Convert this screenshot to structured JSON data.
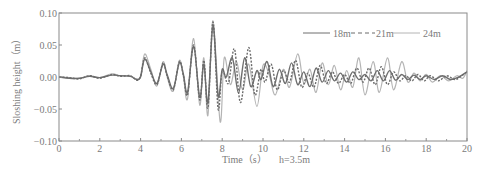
{
  "chart_data": {
    "type": "line",
    "title": "",
    "xlabel": "Time（s）",
    "annotation": "h=3.5m",
    "ylabel": "Sloshing height（m）",
    "xlim": [
      0,
      20
    ],
    "ylim": [
      -0.1,
      0.1
    ],
    "x_ticks": [
      0,
      2,
      4,
      6,
      8,
      10,
      12,
      14,
      16,
      18,
      20
    ],
    "x_tick_labels": [
      "0",
      "2",
      "4",
      "6",
      "8",
      "10",
      "12",
      "14",
      "16",
      "18",
      "20"
    ],
    "x_minor_ticks": [
      1,
      3,
      5,
      7,
      9,
      11,
      13,
      15,
      17,
      19
    ],
    "y_ticks": [
      0.1,
      0.05,
      0.0,
      -0.05,
      -0.1
    ],
    "y_tick_labels": [
      "0.10",
      "0.05",
      "0.00",
      "−0.05",
      "−0.10"
    ],
    "grid": false,
    "legend_position": "upper right",
    "series": [
      {
        "name": "18m",
        "style": "solid",
        "color": "#6e6e6e",
        "keypoints": [
          [
            0,
            0.0
          ],
          [
            0.5,
            -0.002
          ],
          [
            1.0,
            -0.002
          ],
          [
            1.5,
            0.001
          ],
          [
            2.0,
            -0.001
          ],
          [
            2.6,
            0.003
          ],
          [
            3.0,
            0.002
          ],
          [
            3.5,
            0.001
          ],
          [
            3.8,
            -0.004
          ],
          [
            4.0,
            0.0
          ],
          [
            4.2,
            0.028
          ],
          [
            4.5,
            0.008
          ],
          [
            4.8,
            -0.01
          ],
          [
            5.1,
            0.02
          ],
          [
            5.3,
            0.004
          ],
          [
            5.6,
            -0.018
          ],
          [
            5.9,
            0.022
          ],
          [
            6.1,
            0.004
          ],
          [
            6.3,
            -0.024
          ],
          [
            6.6,
            0.048
          ],
          [
            6.9,
            -0.032
          ],
          [
            7.1,
            0.02
          ],
          [
            7.3,
            -0.04
          ],
          [
            7.55,
            0.08
          ],
          [
            7.8,
            -0.03
          ],
          [
            8.0,
            0.012
          ],
          [
            8.2,
            0.0
          ],
          [
            8.5,
            0.03
          ],
          [
            8.8,
            -0.025
          ],
          [
            9.1,
            0.03
          ],
          [
            9.4,
            -0.015
          ],
          [
            9.7,
            0.01
          ],
          [
            9.9,
            -0.004
          ],
          [
            10.2,
            0.024
          ],
          [
            10.5,
            -0.015
          ],
          [
            10.8,
            0.012
          ],
          [
            11.1,
            -0.01
          ],
          [
            11.4,
            0.022
          ],
          [
            11.7,
            -0.012
          ],
          [
            12.0,
            0.008
          ],
          [
            12.3,
            -0.015
          ],
          [
            12.6,
            0.014
          ],
          [
            12.9,
            -0.008
          ],
          [
            13.2,
            0.01
          ],
          [
            13.5,
            -0.006
          ],
          [
            13.8,
            0.006
          ],
          [
            14.1,
            -0.008
          ],
          [
            14.4,
            0.008
          ],
          [
            14.7,
            -0.004
          ],
          [
            15.0,
            0.004
          ],
          [
            15.3,
            -0.006
          ],
          [
            15.6,
            0.01
          ],
          [
            15.9,
            -0.006
          ],
          [
            16.2,
            0.01
          ],
          [
            16.5,
            -0.005
          ],
          [
            16.8,
            0.004
          ],
          [
            17.1,
            -0.004
          ],
          [
            17.4,
            0.003
          ],
          [
            17.7,
            -0.004
          ],
          [
            18.0,
            0.002
          ],
          [
            18.4,
            -0.004
          ],
          [
            18.8,
            0.002
          ],
          [
            19.2,
            -0.004
          ],
          [
            19.6,
            0.0
          ],
          [
            20.0,
            0.008
          ]
        ]
      },
      {
        "name": "21m",
        "style": "dashed",
        "color": "#6a6a6a",
        "keypoints": [
          [
            0,
            0.0
          ],
          [
            0.5,
            -0.001
          ],
          [
            1.0,
            -0.003
          ],
          [
            1.5,
            0.002
          ],
          [
            2.0,
            -0.002
          ],
          [
            2.6,
            0.004
          ],
          [
            3.0,
            0.001
          ],
          [
            3.5,
            0.002
          ],
          [
            3.8,
            -0.005
          ],
          [
            4.0,
            0.001
          ],
          [
            4.2,
            0.03
          ],
          [
            4.5,
            0.006
          ],
          [
            4.8,
            -0.012
          ],
          [
            5.1,
            0.022
          ],
          [
            5.3,
            0.002
          ],
          [
            5.6,
            -0.02
          ],
          [
            5.9,
            0.024
          ],
          [
            6.1,
            0.002
          ],
          [
            6.3,
            -0.028
          ],
          [
            6.6,
            0.05
          ],
          [
            6.9,
            -0.036
          ],
          [
            7.1,
            0.026
          ],
          [
            7.3,
            -0.048
          ],
          [
            7.55,
            0.086
          ],
          [
            7.8,
            -0.05
          ],
          [
            8.0,
            0.01
          ],
          [
            8.3,
            -0.01
          ],
          [
            8.6,
            0.044
          ],
          [
            8.9,
            -0.04
          ],
          [
            9.3,
            0.046
          ],
          [
            9.6,
            -0.028
          ],
          [
            9.9,
            0.012
          ],
          [
            10.1,
            -0.008
          ],
          [
            10.4,
            0.02
          ],
          [
            10.7,
            -0.02
          ],
          [
            11.0,
            0.01
          ],
          [
            11.3,
            -0.008
          ],
          [
            11.6,
            0.026
          ],
          [
            11.9,
            -0.016
          ],
          [
            12.2,
            0.006
          ],
          [
            12.5,
            -0.016
          ],
          [
            12.8,
            0.018
          ],
          [
            13.1,
            -0.01
          ],
          [
            13.4,
            0.008
          ],
          [
            13.7,
            -0.01
          ],
          [
            14.0,
            0.004
          ],
          [
            14.3,
            -0.01
          ],
          [
            14.6,
            0.014
          ],
          [
            14.9,
            -0.008
          ],
          [
            15.2,
            0.014
          ],
          [
            15.5,
            -0.012
          ],
          [
            15.8,
            0.016
          ],
          [
            16.1,
            -0.012
          ],
          [
            16.4,
            0.008
          ],
          [
            16.7,
            -0.006
          ],
          [
            17.0,
            0.002
          ],
          [
            17.3,
            -0.006
          ],
          [
            17.6,
            0.004
          ],
          [
            17.9,
            -0.006
          ],
          [
            18.2,
            0.002
          ],
          [
            18.6,
            -0.006
          ],
          [
            19.0,
            0.002
          ],
          [
            19.4,
            -0.004
          ],
          [
            19.7,
            0.001
          ],
          [
            20.0,
            0.008
          ]
        ]
      },
      {
        "name": "24m",
        "style": "solid",
        "color": "#b4b4b4",
        "keypoints": [
          [
            0,
            0.0
          ],
          [
            0.5,
            -0.001
          ],
          [
            1.0,
            -0.002
          ],
          [
            1.5,
            0.002
          ],
          [
            2.0,
            -0.001
          ],
          [
            2.6,
            0.005
          ],
          [
            3.0,
            0.002
          ],
          [
            3.5,
            0.002
          ],
          [
            3.8,
            -0.003
          ],
          [
            4.0,
            0.002
          ],
          [
            4.2,
            0.036
          ],
          [
            4.5,
            0.012
          ],
          [
            4.8,
            -0.014
          ],
          [
            5.1,
            0.024
          ],
          [
            5.3,
            0.0
          ],
          [
            5.6,
            -0.022
          ],
          [
            5.9,
            0.026
          ],
          [
            6.1,
            0.0
          ],
          [
            6.3,
            -0.034
          ],
          [
            6.6,
            0.06
          ],
          [
            6.9,
            -0.044
          ],
          [
            7.1,
            0.03
          ],
          [
            7.3,
            -0.06
          ],
          [
            7.55,
            0.088
          ],
          [
            7.9,
            -0.07
          ],
          [
            8.1,
            0.03
          ],
          [
            8.4,
            -0.012
          ],
          [
            8.7,
            0.024
          ],
          [
            9.0,
            -0.02
          ],
          [
            9.3,
            0.02
          ],
          [
            9.7,
            -0.046
          ],
          [
            10.0,
            0.018
          ],
          [
            10.3,
            0.004
          ],
          [
            10.6,
            -0.028
          ],
          [
            11.0,
            0.012
          ],
          [
            11.3,
            -0.016
          ],
          [
            11.7,
            0.036
          ],
          [
            12.0,
            -0.01
          ],
          [
            12.3,
            0.012
          ],
          [
            12.6,
            -0.024
          ],
          [
            12.9,
            0.022
          ],
          [
            13.2,
            -0.012
          ],
          [
            13.5,
            0.018
          ],
          [
            13.8,
            -0.02
          ],
          [
            14.1,
            0.01
          ],
          [
            14.4,
            -0.016
          ],
          [
            14.7,
            0.03
          ],
          [
            15.0,
            -0.028
          ],
          [
            15.4,
            0.024
          ],
          [
            15.7,
            -0.024
          ],
          [
            16.1,
            0.03
          ],
          [
            16.4,
            -0.02
          ],
          [
            16.8,
            0.024
          ],
          [
            17.1,
            -0.008
          ],
          [
            17.4,
            0.006
          ],
          [
            17.7,
            -0.006
          ],
          [
            18.0,
            0.004
          ],
          [
            18.3,
            -0.008
          ],
          [
            18.7,
            0.002
          ],
          [
            19.1,
            -0.006
          ],
          [
            19.5,
            0.002
          ],
          [
            19.8,
            -0.002
          ],
          [
            20.0,
            0.01
          ]
        ]
      }
    ]
  },
  "legend": {
    "items": [
      {
        "label": "18m",
        "style": "solid",
        "color": "#6e6e6e"
      },
      {
        "label": "21m",
        "style": "dashed",
        "color": "#6a6a6a"
      },
      {
        "label": "24m",
        "style": "solid",
        "color": "#b4b4b4"
      }
    ]
  },
  "colors": {
    "axis": "#8a8a8a",
    "text": "#7a7a7a",
    "background": "#ffffff"
  }
}
